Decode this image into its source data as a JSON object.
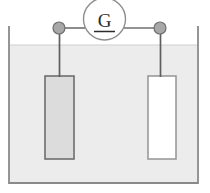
{
  "diagram": {
    "type": "electrochemical-cell",
    "meter": {
      "label": "G",
      "name": "galvanometer",
      "underlined": true,
      "circle": {
        "cx": 104,
        "cy": 19,
        "r": 21,
        "stroke": "#8d8d8d",
        "fill": "#ffffff",
        "stroke_width": 1.3
      },
      "label_color": "#2b2b2b",
      "underline_color": "#2b2b2b"
    },
    "beaker": {
      "name": "beaker",
      "left": 9,
      "right": 198,
      "top": 27,
      "bottom": 183,
      "stroke": "#8a8a8a",
      "stroke_width": 1.6,
      "fill": "none"
    },
    "solution": {
      "name": "electrolyte-solution",
      "surface_y": 45,
      "fill": "#ececec",
      "surface_stroke": "#c9c9c9",
      "left": 10,
      "right": 197,
      "bottom": 182
    },
    "wires": {
      "name": "circuit-wires",
      "color": "#6f6f6f",
      "width": 1.5,
      "horizontal_y": 28,
      "left_segment": {
        "x1": 59,
        "x2": 84,
        "y": 28
      },
      "right_segment": {
        "x1": 125,
        "x2": 160,
        "y": 28
      },
      "left_drop": {
        "x": 59,
        "y1": 28,
        "y2": 77
      },
      "right_drop": {
        "x": 160,
        "y1": 28,
        "y2": 77
      }
    },
    "terminals": [
      {
        "name": "left-terminal",
        "cx": 59,
        "cy": 28,
        "r": 6,
        "fill": "#a8a8a8",
        "stroke": "#6f6f6f"
      },
      {
        "name": "right-terminal",
        "cx": 160,
        "cy": 28,
        "r": 6,
        "fill": "#a8a8a8",
        "stroke": "#6f6f6f"
      }
    ],
    "electrodes": [
      {
        "name": "left-electrode",
        "label": "",
        "x": 45,
        "y": 76,
        "width": 29,
        "height": 83,
        "fill": "#dcdcdc",
        "stroke": "#6e6e6e",
        "stroke_width": 1.6,
        "shaded": true
      },
      {
        "name": "right-electrode",
        "label": "",
        "x": 148,
        "y": 76,
        "width": 28,
        "height": 83,
        "fill": "#ffffff",
        "stroke": "#9a9a9a",
        "stroke_width": 1.6,
        "shaded": false
      }
    ],
    "colors": {
      "background": "#ffffff",
      "solution": "#ececec",
      "electrode_shaded": "#dcdcdc",
      "electrode_plain": "#ffffff",
      "outline": "#8a8a8a",
      "wire": "#6f6f6f",
      "terminal": "#a8a8a8",
      "text": "#2b2b2b"
    }
  }
}
